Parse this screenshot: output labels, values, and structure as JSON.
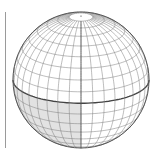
{
  "figure": {
    "type": "wireframe-sphere",
    "center": [
      81,
      80
    ],
    "radius": 68,
    "tilt_deg": 20,
    "lon_step_deg": 10,
    "lat_step_deg": 10,
    "polar_cap_lat_deg": 80,
    "colors": {
      "grid": "#7a7a7a",
      "outline": "#555555",
      "equator": "#444444",
      "central_meridian": "#555555",
      "shade": "#e2e2e2",
      "background": "#ffffff"
    },
    "shaded_region": {
      "lon_range_deg": [
        -90,
        0
      ],
      "lat_range_deg": [
        -90,
        0
      ]
    }
  }
}
